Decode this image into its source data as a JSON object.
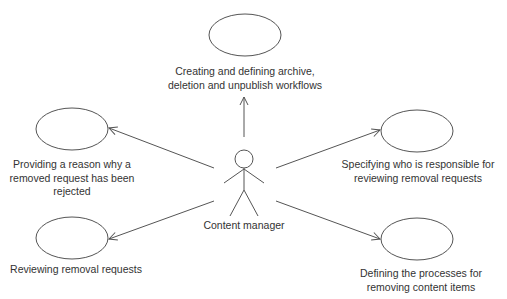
{
  "diagram": {
    "type": "use-case",
    "actor": {
      "label": "Content manager"
    },
    "use_cases": [
      {
        "id": "top",
        "lines": [
          "Creating and defining archive,",
          "deletion and unpublish workflows"
        ]
      },
      {
        "id": "left-upper",
        "lines": [
          "Providing a reason why a",
          "removed request has been",
          "rejected"
        ]
      },
      {
        "id": "right-upper",
        "lines": [
          "Specifying who is responsible for",
          "reviewing removal requests"
        ]
      },
      {
        "id": "left-lower",
        "lines": [
          "Reviewing removal requests"
        ]
      },
      {
        "id": "right-lower",
        "lines": [
          "Defining the processes for",
          "removing content items"
        ]
      }
    ],
    "colors": {
      "stroke": "#555555",
      "text": "#333333",
      "background": "#ffffff"
    }
  }
}
